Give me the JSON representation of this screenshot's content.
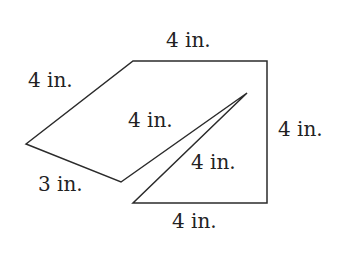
{
  "figure": {
    "stroke_color": "#2b2b2b",
    "vertices": {
      "left": [
        26,
        144
      ],
      "bottom_left": [
        121,
        182
      ],
      "top_left": [
        133,
        61
      ],
      "top_right": [
        267,
        61
      ],
      "bottom_right": [
        267,
        203
      ],
      "bottom_mid": [
        133,
        203
      ],
      "spike_tip": [
        247,
        93
      ]
    },
    "labels": {
      "top": "4 in.",
      "upper_left": "4 in.",
      "lower_left": "3 in.",
      "inner_upper": "4 in.",
      "inner_lower": "4 in.",
      "right": "4 in.",
      "bottom": "4 in."
    }
  }
}
